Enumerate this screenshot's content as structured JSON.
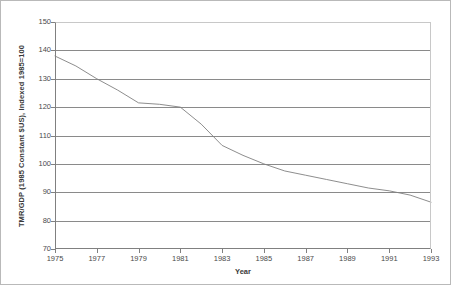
{
  "chart_data": {
    "type": "line",
    "title": "",
    "xlabel": "Year",
    "ylabel": "TMR/GDP (1985 Constant $US), Indexed 1985=100",
    "xlim": [
      1975,
      1993
    ],
    "ylim": [
      70,
      150
    ],
    "yticks": [
      150,
      140,
      130,
      120,
      110,
      100,
      90,
      80,
      70
    ],
    "ytick_labels": [
      "150",
      "140",
      "130",
      "120",
      "110",
      "100",
      "90",
      "80",
      "70"
    ],
    "xticks": [
      1975,
      1977,
      1979,
      1981,
      1983,
      1985,
      1987,
      1989,
      1991,
      1993
    ],
    "xtick_labels": [
      "1975",
      "1977",
      "1979",
      "1981",
      "1983",
      "1985",
      "1987",
      "1989",
      "1991",
      "1993"
    ],
    "grid": "horizontal",
    "legend": "none",
    "line_color": "#808080",
    "x": [
      1975,
      1976,
      1977,
      1978,
      1979,
      1980,
      1981,
      1982,
      1983,
      1984,
      1985,
      1986,
      1987,
      1988,
      1989,
      1990,
      1991,
      1992,
      1993
    ],
    "values": [
      138,
      134.5,
      130,
      126,
      121.5,
      121,
      120,
      114,
      106.5,
      103,
      100,
      97.5,
      96,
      94.5,
      93,
      91.5,
      90.5,
      89,
      86.5
    ],
    "series": [
      {
        "name": "TMR/GDP",
        "values": [
          138,
          134.5,
          130,
          126,
          121.5,
          121,
          120,
          114,
          106.5,
          103,
          100,
          97.5,
          96,
          94.5,
          93,
          91.5,
          90.5,
          89,
          86.5
        ]
      }
    ]
  },
  "axis_title_color": "#3a3a3a",
  "tick_label_color": "#4a4a4a",
  "grid_color": "#8a8a8a",
  "border_color": "#b9b9b9"
}
